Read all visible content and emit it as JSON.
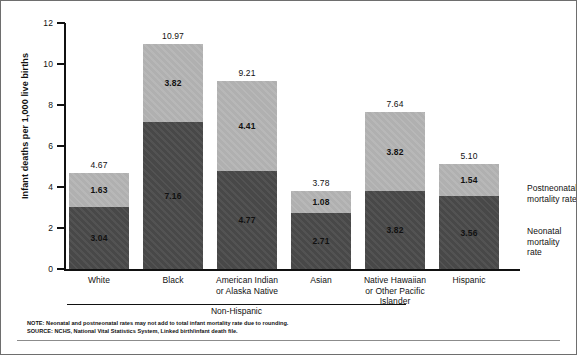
{
  "chart_data": {
    "type": "bar",
    "subtype": "stacked-vertical",
    "title": "",
    "xlabel": "",
    "ylabel": "Infant deaths per 1,000 live births",
    "ylim": [
      0,
      12
    ],
    "yticks": [
      "0",
      "2",
      "4",
      "6",
      "8",
      "10",
      "12"
    ],
    "grid": false,
    "legend_position": "right-inline",
    "categories": [
      "White",
      "Black",
      "American Indian or Alaska Native",
      "Asian",
      "Native Hawaiian or Other Pacific Islander",
      "Hispanic"
    ],
    "category_lines": [
      [
        "White"
      ],
      [
        "Black"
      ],
      [
        "American Indian",
        "or Alaska Native"
      ],
      [
        "Asian"
      ],
      [
        "Native Hawaiian",
        "or Other Pacific",
        "Islander"
      ],
      [
        "Hispanic"
      ]
    ],
    "series": [
      {
        "name": "Neonatal mortality rate",
        "color": "#4b4b4b",
        "values": [
          3.04,
          7.16,
          4.77,
          2.71,
          3.82,
          3.56
        ],
        "labels": [
          "3.04",
          "7.16",
          "4.77",
          "2.71",
          "3.82",
          "3.56"
        ]
      },
      {
        "name": "Postneonatal mortality rate",
        "color": "#b4b4b4",
        "values": [
          1.63,
          3.82,
          4.41,
          1.08,
          3.82,
          1.54
        ],
        "labels": [
          "1.63",
          "3.82",
          "4.41",
          "1.08",
          "3.82",
          "1.54"
        ]
      }
    ],
    "totals": [
      4.67,
      10.97,
      9.21,
      3.78,
      7.64,
      5.1
    ],
    "total_labels": [
      "4.67",
      "10.97",
      "9.21",
      "3.78",
      "7.64",
      "5.10"
    ],
    "annotations": {
      "group_bracket_label": "Non-Hispanic",
      "group_bracket_members": [
        "White",
        "Black",
        "American Indian or Alaska Native",
        "Asian",
        "Native Hawaiian or Other Pacific Islander"
      ]
    }
  },
  "legend": {
    "postneonatal_line1": "Postneonatal",
    "postneonatal_line2": "mortality rate",
    "neonatal_line1": "Neonatal",
    "neonatal_line2": "mortality rate"
  },
  "footnotes": {
    "note": "NOTE: Neonatal and postneonatal rates may not add to total infant mortality rate due to rounding.",
    "source": "SOURCE: NCHS, National Vital Statistics System, Linked birth/infant death file."
  }
}
